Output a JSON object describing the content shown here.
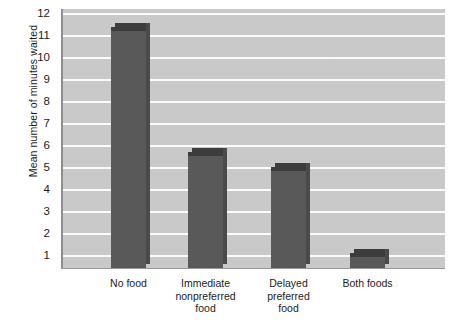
{
  "chart_data": {
    "type": "bar",
    "title": "",
    "subtitle": "",
    "xlabel": "",
    "ylabel": "Mean number of minutes waited",
    "categories": [
      "No food",
      "Immediate\nnonpreferred\nfood",
      "Delayed\npreferred\nfood",
      "Both foods"
    ],
    "category_lines": [
      [
        "No food"
      ],
      [
        "Immediate",
        "nonpreferred",
        "food"
      ],
      [
        "Delayed",
        "preferred",
        "food"
      ],
      [
        "Both foods"
      ]
    ],
    "values": [
      11.4,
      5.75,
      5.05,
      1.15
    ],
    "ylim": [
      0,
      12
    ],
    "ytick_labels": [
      "12",
      "11",
      "10",
      "9",
      "8",
      "7",
      "6",
      "5",
      "4",
      "3",
      "2",
      "1"
    ],
    "ytick_values": [
      12,
      11,
      10,
      9,
      8,
      7,
      6,
      5,
      4,
      3,
      2,
      1
    ],
    "grid": "horizontal-white-gridlines",
    "legend": "none",
    "legend_position": "none",
    "annotations": []
  },
  "style": {
    "plot_background": "#c9c9c9",
    "gridline_color": "#fbfbfb",
    "bar_color": "#595959",
    "bar_shadow_color": "#3d3d3d",
    "bar_side_color": "#4a4a4a",
    "axis_color": "#8e8e8e",
    "text_color": "#1c1c1c",
    "page_background": "#ffffff"
  },
  "geometry": {
    "plot_left": 62,
    "plot_top": 9,
    "plot_width": 382,
    "plot_height": 259,
    "gridline_top_y": 14,
    "gridline_spacing": 22.0,
    "bar_width": 35,
    "bar_centers": [
      128.5,
      205.5,
      288.5,
      367.5
    ]
  }
}
